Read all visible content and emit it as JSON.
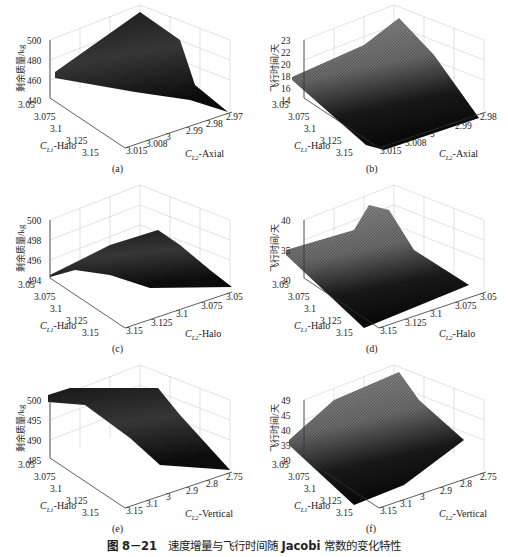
{
  "figure": {
    "number": "图 8－21",
    "title_prefix": "速度增量与飞行时间随",
    "title_bold": "Jacobi",
    "title_suffix": "常数的变化特性"
  },
  "panels": [
    {
      "caption": "(a)",
      "zlabel": "剩余质量/kg",
      "zticks": [
        "500",
        "480",
        "460",
        "440"
      ],
      "x1label": "-Halo",
      "x1sym": "C",
      "x1sub": "L1",
      "x1ticks": [
        "3.05",
        "3.075",
        "3.1",
        "3.125",
        "3.15"
      ],
      "x2label": "-Axial",
      "x2sym": "C",
      "x2sub": "L2",
      "x2ticks": [
        "3.015",
        "3.008",
        "3",
        "2.99",
        "2.98",
        "2.97"
      ]
    },
    {
      "caption": "(b)",
      "zlabel": "飞行时间/天",
      "zticks": [
        "23",
        "22",
        "20",
        "18",
        "16",
        "14"
      ],
      "x1label": "-Halo",
      "x1sym": "C",
      "x1sub": "L1",
      "x1ticks": [
        "3.05",
        "3.075",
        "3.1",
        "3.125",
        "3.15"
      ],
      "x2label": "-Axial",
      "x2sym": "C",
      "x2sub": "L2",
      "x2ticks": [
        "3.015",
        "3.008",
        "3",
        "2.99",
        "2.98"
      ]
    },
    {
      "caption": "(c)",
      "zlabel": "剩余质量/kg",
      "zticks": [
        "500",
        "498",
        "496",
        "494"
      ],
      "x1label": "-Halo",
      "x1sym": "C",
      "x1sub": "L1",
      "x1ticks": [
        "3.05",
        "3.075",
        "3.1",
        "3.125",
        "3.15"
      ],
      "x2label": "-Halo",
      "x2sym": "C",
      "x2sub": "L2",
      "x2ticks": [
        "3.15",
        "3.125",
        "3.1",
        "3.075",
        "3.05"
      ]
    },
    {
      "caption": "(d)",
      "zlabel": "飞行时间/天",
      "zticks": [
        "40",
        "35",
        "30"
      ],
      "x1label": "-Halo",
      "x1sym": "C",
      "x1sub": "L1",
      "x1ticks": [
        "3.05",
        "3.075",
        "3.1",
        "3.125",
        "3.15"
      ],
      "x2label": "-Halo",
      "x2sym": "C",
      "x2sub": "L2",
      "x2ticks": [
        "3.15",
        "3.125",
        "3.1",
        "3.075",
        "3.05"
      ]
    },
    {
      "caption": "(e)",
      "zlabel": "剩余质量/kg",
      "zticks": [
        "500",
        "495",
        "490",
        "485"
      ],
      "x1label": "-Halo",
      "x1sym": "C",
      "x1sub": "L1",
      "x1ticks": [
        "3.05",
        "3.075",
        "3.1",
        "3.125",
        "3.15"
      ],
      "x2label": "-Vertical",
      "x2sym": "C",
      "x2sub": "L2",
      "x2ticks": [
        "3.15",
        "3.1",
        "3",
        "2.9",
        "2.8",
        "2.75"
      ]
    },
    {
      "caption": "(f)",
      "zlabel": "飞行时间/天",
      "zticks": [
        "49",
        "45",
        "40",
        "35",
        "30"
      ],
      "x1label": "-Halo",
      "x1sym": "C",
      "x1sub": "L1",
      "x1ticks": [
        "3.05",
        "3.075",
        "3.1",
        "3.125",
        "3.15"
      ],
      "x2label": "-Vertical",
      "x2sym": "C",
      "x2sub": "L2",
      "x2ticks": [
        "3.15",
        "3.1",
        "3",
        "2.9",
        "2.8",
        "2.75"
      ]
    }
  ],
  "chart_data": [
    {
      "type": "surface",
      "title": "(a)",
      "xlabel": "C_L1-Halo",
      "ylabel": "C_L2-Axial",
      "zlabel": "剩余质量/kg",
      "x_ticks": [
        3.05,
        3.075,
        3.1,
        3.125,
        3.15
      ],
      "y_ticks": [
        3.015,
        3.008,
        3,
        2.99,
        2.98,
        2.97
      ],
      "z_ticks": [
        440,
        460,
        480,
        500
      ],
      "xlim": [
        3.05,
        3.15
      ],
      "ylim": [
        2.97,
        3.015
      ],
      "zlim": [
        440,
        500
      ],
      "grid": true,
      "description": "Remaining mass surface; peaks ~500 kg near C_L1=3.05,C_L2≈2.99, falls to ~440 kg at C_L2=2.97 corner; ~470 kg at C_L1=3.05,C_L2=3.015."
    },
    {
      "type": "surface",
      "title": "(b)",
      "xlabel": "C_L1-Halo",
      "ylabel": "C_L2-Axial",
      "zlabel": "飞行时间/天",
      "x_ticks": [
        3.05,
        3.075,
        3.1,
        3.125,
        3.15
      ],
      "y_ticks": [
        3.015,
        3.008,
        3,
        2.99,
        2.98
      ],
      "z_ticks": [
        14,
        16,
        18,
        20,
        22,
        23
      ],
      "xlim": [
        3.05,
        3.15
      ],
      "ylim": [
        2.98,
        3.015
      ],
      "zlim": [
        14,
        23
      ],
      "grid": true,
      "description": "Flight time surface; ~18 days at C_L1=3.05,C_L2=3.015, rising to ~23 days near C_L2=2.98, falling to ~14 days at C_L1=3.15."
    },
    {
      "type": "surface",
      "title": "(c)",
      "xlabel": "C_L1-Halo",
      "ylabel": "C_L2-Halo",
      "zlabel": "剩余质量/kg",
      "x_ticks": [
        3.05,
        3.075,
        3.1,
        3.125,
        3.15
      ],
      "y_ticks": [
        3.15,
        3.125,
        3.1,
        3.075,
        3.05
      ],
      "z_ticks": [
        494,
        496,
        498,
        500
      ],
      "xlim": [
        3.05,
        3.15
      ],
      "ylim": [
        3.05,
        3.15
      ],
      "zlim": [
        494,
        500
      ],
      "grid": true,
      "description": "Remaining mass surface; ~494 kg at corners, peak ~498.5 kg in middle of back region."
    },
    {
      "type": "surface",
      "title": "(d)",
      "xlabel": "C_L1-Halo",
      "ylabel": "C_L2-Halo",
      "zlabel": "飞行时间/天",
      "x_ticks": [
        3.05,
        3.075,
        3.1,
        3.125,
        3.15
      ],
      "y_ticks": [
        3.15,
        3.125,
        3.1,
        3.075,
        3.05
      ],
      "z_ticks": [
        30,
        35,
        40
      ],
      "xlim": [
        3.05,
        3.15
      ],
      "ylim": [
        3.05,
        3.15
      ],
      "zlim": [
        28,
        42
      ],
      "grid": true,
      "description": "Flight time surface; ~35 days at C_L1=3.05 front edge, peaks ~42 near back corner, drops to ~28 days at C_L1=3.15."
    },
    {
      "type": "surface",
      "title": "(e)",
      "xlabel": "C_L1-Halo",
      "ylabel": "C_L2-Vertical",
      "zlabel": "剩余质量/kg",
      "x_ticks": [
        3.05,
        3.075,
        3.1,
        3.125,
        3.15
      ],
      "y_ticks": [
        3.15,
        3.1,
        3,
        2.9,
        2.8,
        2.75
      ],
      "z_ticks": [
        485,
        490,
        495,
        500
      ],
      "xlim": [
        3.05,
        3.15
      ],
      "ylim": [
        2.75,
        3.15
      ],
      "zlim": [
        485,
        500
      ],
      "grid": true,
      "description": "Remaining mass surface; plateau ~500 kg near C_L1=3.05, decreasing to ~485 kg toward C_L2=2.75 and C_L1=3.15."
    },
    {
      "type": "surface",
      "title": "(f)",
      "xlabel": "C_L1-Halo",
      "ylabel": "C_L2-Vertical",
      "zlabel": "飞行时间/天",
      "x_ticks": [
        3.05,
        3.075,
        3.1,
        3.125,
        3.15
      ],
      "y_ticks": [
        3.15,
        3.1,
        3,
        2.9,
        2.8,
        2.75
      ],
      "z_ticks": [
        30,
        35,
        40,
        45,
        49
      ],
      "xlim": [
        3.05,
        3.15
      ],
      "ylim": [
        2.75,
        3.15
      ],
      "zlim": [
        28,
        49
      ],
      "grid": true,
      "description": "Flight time surface; ~35 days at C_L1=3.05,C_L2=3.15, rising to ~49 days at back corner, ~40 at C_L2=2.75 right edge, ~28 days at C_L1=3.15."
    }
  ]
}
